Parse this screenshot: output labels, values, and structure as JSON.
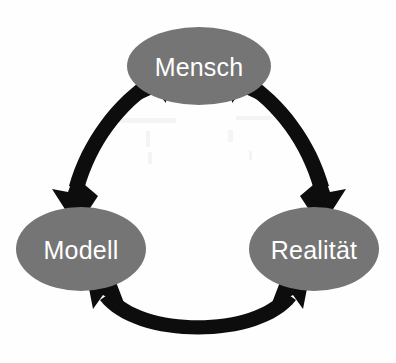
{
  "diagram": {
    "type": "cycle-diagram",
    "background_color": "#fefefe",
    "node_fill_color": "#757575",
    "node_text_color": "#ffffff",
    "arrow_color": "#0d0d0d",
    "nodes": [
      {
        "id": "mensch",
        "label": "Mensch",
        "position": "top",
        "cx": 199,
        "cy": 66,
        "rx": 72,
        "ry": 39
      },
      {
        "id": "modell",
        "label": "Modell",
        "position": "bottom-left",
        "cx": 81,
        "cy": 249,
        "rx": 65,
        "ry": 42
      },
      {
        "id": "realitaet",
        "label": "Realität",
        "position": "bottom-right",
        "cx": 314,
        "cy": 249,
        "rx": 65,
        "ry": 42
      }
    ],
    "connectors": [
      {
        "id": "mensch-modell",
        "from": "mensch",
        "to": "modell",
        "direction": "bidirectional",
        "style": "curved-thick-double-arrow"
      },
      {
        "id": "mensch-realitaet",
        "from": "mensch",
        "to": "realitaet",
        "direction": "bidirectional",
        "style": "curved-thick-double-arrow"
      },
      {
        "id": "modell-realitaet",
        "from": "modell",
        "to": "realitaet",
        "direction": "bidirectional",
        "style": "curved-thick-double-arrow"
      }
    ]
  }
}
